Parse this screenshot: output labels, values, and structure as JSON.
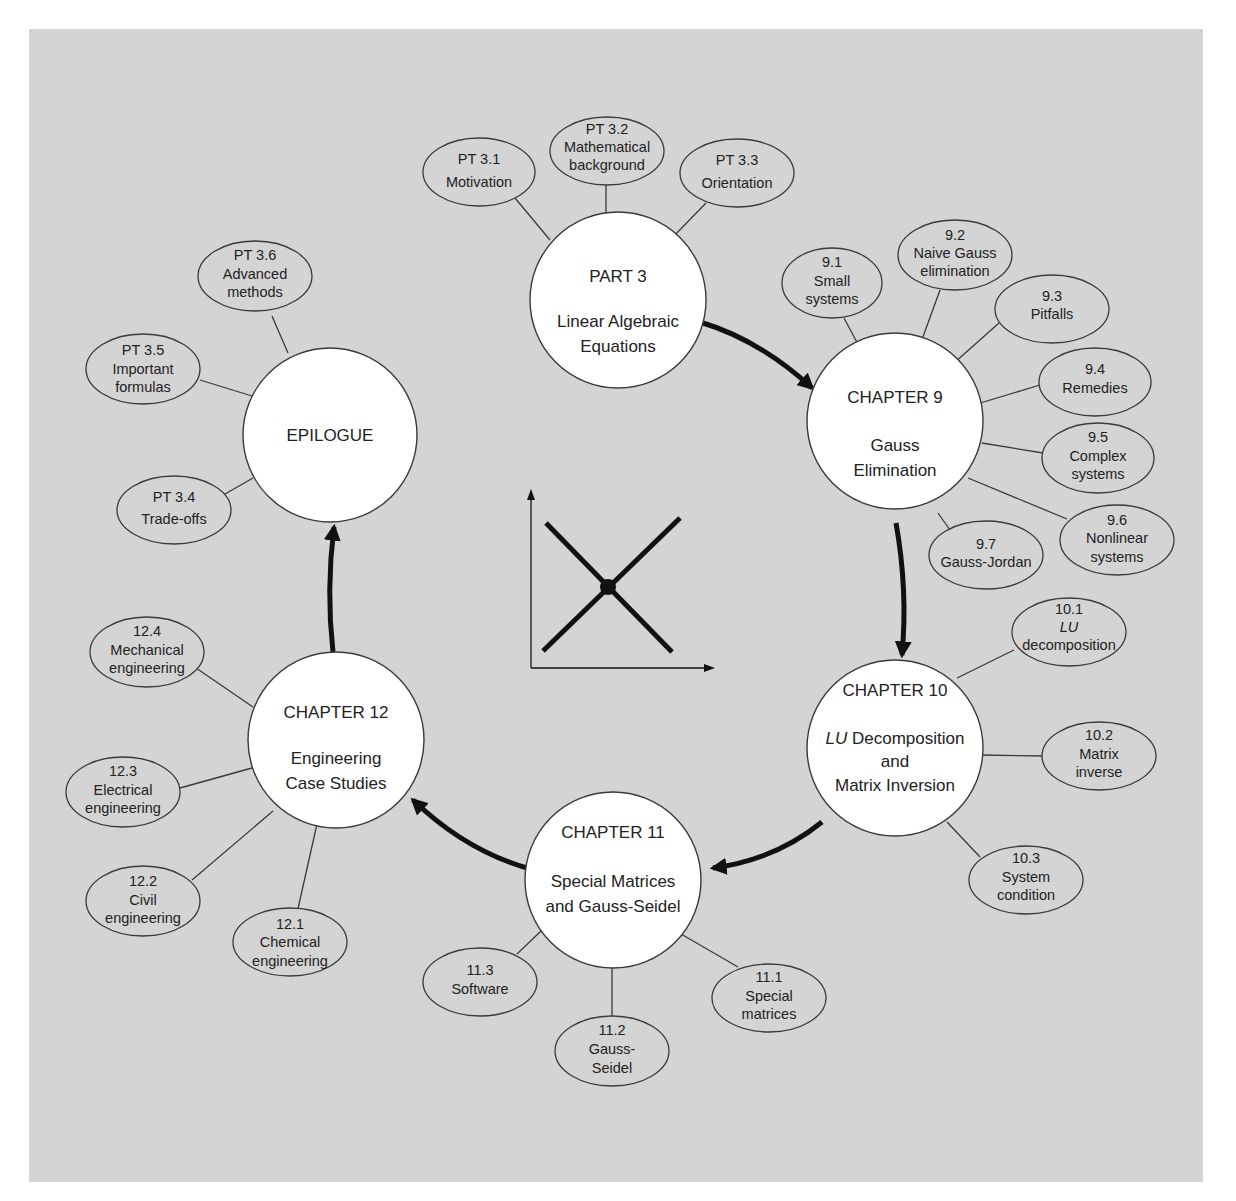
{
  "diagram": {
    "hubs": [
      {
        "id": "part3",
        "lines": [
          "PART 3",
          "",
          "Linear Algebraic",
          "Equations"
        ]
      },
      {
        "id": "ch9",
        "lines": [
          "CHAPTER 9",
          "",
          "Gauss",
          "Elimination"
        ]
      },
      {
        "id": "ch10",
        "lines": [
          "CHAPTER 10",
          "",
          "LU Decomposition",
          "and",
          "Matrix Inversion"
        ],
        "italic_prefix": "LU"
      },
      {
        "id": "ch11",
        "lines": [
          "CHAPTER 11",
          "",
          "Special Matrices",
          "and Gauss-Seidel"
        ]
      },
      {
        "id": "ch12",
        "lines": [
          "CHAPTER 12",
          "",
          "Engineering",
          "Case Studies"
        ]
      },
      {
        "id": "epilogue",
        "lines": [
          "EPILOGUE"
        ]
      }
    ],
    "leaves": {
      "part3": [
        {
          "num": "PT 3.1",
          "label": [
            "Motivation"
          ]
        },
        {
          "num": "PT 3.2",
          "label": [
            "Mathematical",
            "background"
          ]
        },
        {
          "num": "PT 3.3",
          "label": [
            "Orientation"
          ]
        }
      ],
      "ch9": [
        {
          "num": "9.1",
          "label": [
            "Small",
            "systems"
          ]
        },
        {
          "num": "9.2",
          "label": [
            "Naive Gauss",
            "elimination"
          ]
        },
        {
          "num": "9.3",
          "label": [
            "Pitfalls"
          ]
        },
        {
          "num": "9.4",
          "label": [
            "Remedies"
          ]
        },
        {
          "num": "9.5",
          "label": [
            "Complex",
            "systems"
          ]
        },
        {
          "num": "9.6",
          "label": [
            "Nonlinear",
            "systems"
          ]
        },
        {
          "num": "9.7",
          "label": [
            "Gauss-Jordan"
          ]
        }
      ],
      "ch10": [
        {
          "num": "10.1",
          "label": [
            "LU",
            "decomposition"
          ],
          "italic_first": true
        },
        {
          "num": "10.2",
          "label": [
            "Matrix",
            "inverse"
          ]
        },
        {
          "num": "10.3",
          "label": [
            "System",
            "condition"
          ]
        }
      ],
      "ch11": [
        {
          "num": "11.1",
          "label": [
            "Special",
            "matrices"
          ]
        },
        {
          "num": "11.2",
          "label": [
            "Gauss-",
            "Seidel"
          ]
        },
        {
          "num": "11.3",
          "label": [
            "Software"
          ]
        }
      ],
      "ch12": [
        {
          "num": "12.1",
          "label": [
            "Chemical",
            "engineering"
          ]
        },
        {
          "num": "12.2",
          "label": [
            "Civil",
            "engineering"
          ]
        },
        {
          "num": "12.3",
          "label": [
            "Electrical",
            "engineering"
          ]
        },
        {
          "num": "12.4",
          "label": [
            "Mechanical",
            "engineering"
          ]
        }
      ],
      "epilogue": [
        {
          "num": "PT 3.4",
          "label": [
            "Trade-offs"
          ]
        },
        {
          "num": "PT 3.5",
          "label": [
            "Important",
            "formulas"
          ]
        },
        {
          "num": "PT 3.6",
          "label": [
            "Advanced",
            "methods"
          ]
        }
      ]
    },
    "flow": [
      "part3",
      "ch9",
      "ch10",
      "ch11",
      "ch12",
      "epilogue"
    ],
    "center_icon": "intersecting-lines-graph-icon",
    "colors": {
      "panel": "#d4d4d4",
      "hub_fill": "#ffffff",
      "stroke": "#3a3a3a",
      "arrow": "#111111"
    }
  }
}
